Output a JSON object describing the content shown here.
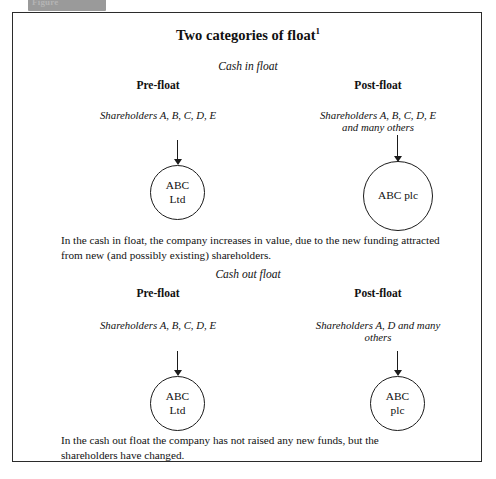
{
  "figure_tab": {
    "label": "Figure"
  },
  "figure": {
    "title": "Two categories of float",
    "title_footnote": "1",
    "sections": [
      {
        "name": "cash-in-float",
        "label": "Cash in float",
        "columns": [
          {
            "side": "pre",
            "heading": "Pre-float",
            "shareholders": "Shareholders A, B, C, D, E",
            "entity_line1": "ABC",
            "entity_line2": "Ltd"
          },
          {
            "side": "post",
            "heading": "Post-float",
            "shareholders_line1": "Shareholders A, B, C, D, E",
            "shareholders_line2": "and many others",
            "entity_line1": "ABC plc",
            "entity_line2": ""
          }
        ],
        "caption_line1": "In the cash in float, the company increases in value, due to the new funding attracted",
        "caption_line2": "from new (and possibly existing) shareholders."
      },
      {
        "name": "cash-out-float",
        "label": "Cash out float",
        "columns": [
          {
            "side": "pre",
            "heading": "Pre-float",
            "shareholders": "Shareholders A, B, C, D, E",
            "entity_line1": "ABC",
            "entity_line2": "Ltd"
          },
          {
            "side": "post",
            "heading": "Post-float",
            "shareholders_line1": "Shareholders A, D and many",
            "shareholders_line2": "others",
            "entity_line1": "ABC",
            "entity_line2": "plc"
          }
        ],
        "caption_line1": "In the cash out float the company has not raised any new funds, but the",
        "caption_line2": "shareholders have changed."
      }
    ]
  },
  "colors": {
    "ink": "#1b1b1b",
    "frame": "#2b2b2b",
    "tab_background": "#9a9a9a",
    "page_background": "#ffffff"
  }
}
